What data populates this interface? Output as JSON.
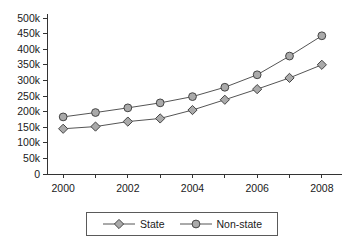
{
  "chart_data": {
    "type": "line",
    "title": "",
    "subtitle": "",
    "xlabel": "",
    "ylabel": "",
    "x": [
      2000,
      2001,
      2002,
      2003,
      2004,
      2005,
      2006,
      2007,
      2008
    ],
    "xtick_labels": [
      "2000",
      "2002",
      "2004",
      "2006",
      "2008"
    ],
    "xtick_values": [
      2000,
      2002,
      2004,
      2006,
      2008
    ],
    "xlim": [
      1999.5,
      2008.5
    ],
    "ytick_labels": [
      "0",
      "50k",
      "100k",
      "150k",
      "200k",
      "250k",
      "300k",
      "350k",
      "400k",
      "450k",
      "500k"
    ],
    "ytick_values": [
      0,
      50000,
      100000,
      150000,
      200000,
      250000,
      300000,
      350000,
      400000,
      450000,
      500000
    ],
    "ylim": [
      0,
      500000
    ],
    "grid": false,
    "legend_position": "bottom-center",
    "series": [
      {
        "name": "State",
        "marker": "diamond",
        "color": "#555555",
        "marker_fill": "#aaaaaa",
        "values": [
          145000,
          152000,
          168000,
          178000,
          205000,
          238000,
          272000,
          308000,
          350000
        ]
      },
      {
        "name": "Non-state",
        "marker": "circle",
        "color": "#555555",
        "marker_fill": "#aaaaaa",
        "values": [
          183000,
          197000,
          212000,
          228000,
          248000,
          278000,
          318000,
          378000,
          443000
        ]
      }
    ]
  },
  "legend": {
    "entries": [
      {
        "label": "State"
      },
      {
        "label": "Non-state"
      }
    ]
  },
  "colors": {
    "axis": "#333333",
    "line": "#555555",
    "marker_fill": "#aaaaaa",
    "marker_stroke": "#444444",
    "background": "#ffffff",
    "legend_border": "#5a5a5a"
  }
}
